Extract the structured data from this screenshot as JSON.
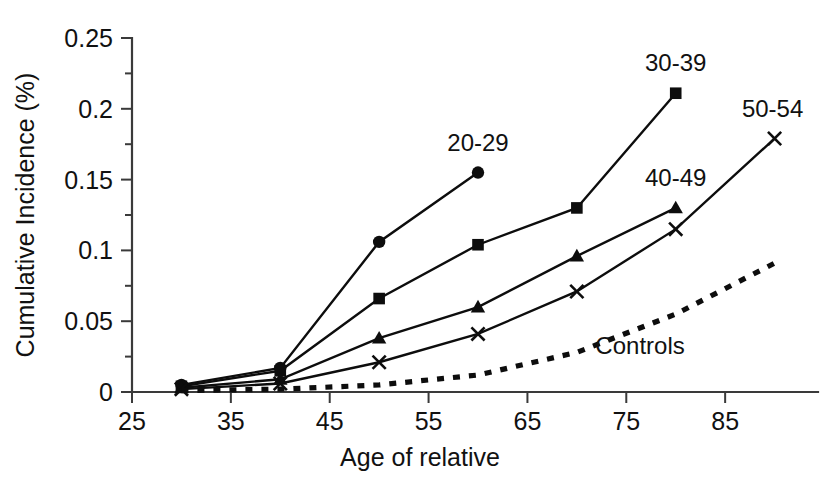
{
  "chart_data": {
    "type": "line",
    "title": "",
    "xlabel": "Age of relative",
    "ylabel": "Cumulative Incidence (%)",
    "xlim": [
      25,
      95
    ],
    "ylim": [
      0,
      0.25
    ],
    "grid": false,
    "legend_position": "inline-endpoint-labels",
    "xticks": [
      "25",
      "35",
      "45",
      "55",
      "65",
      "75",
      "85"
    ],
    "xtick_values": [
      25,
      35,
      45,
      55,
      65,
      75,
      85
    ],
    "yticks": [
      "0",
      "0.05",
      "0.1",
      "0.15",
      "0.2",
      "0.25"
    ],
    "ytick_values": [
      0,
      0.05,
      0.1,
      0.15,
      0.2,
      0.25
    ],
    "series": [
      {
        "name": "20-29",
        "marker": "circle",
        "linestyle": "solid",
        "label_text": "20-29",
        "x": [
          30,
          40,
          50,
          60
        ],
        "values": [
          0.005,
          0.017,
          0.106,
          0.155
        ]
      },
      {
        "name": "30-39",
        "marker": "square",
        "linestyle": "solid",
        "label_text": "30-39",
        "x": [
          30,
          40,
          50,
          60,
          70,
          80
        ],
        "values": [
          0.004,
          0.015,
          0.066,
          0.104,
          0.13,
          0.211
        ]
      },
      {
        "name": "40-49",
        "marker": "triangle",
        "linestyle": "solid",
        "label_text": "40-49",
        "x": [
          30,
          40,
          50,
          60,
          70,
          80
        ],
        "values": [
          0.003,
          0.009,
          0.038,
          0.06,
          0.096,
          0.13
        ]
      },
      {
        "name": "50-54",
        "marker": "x",
        "linestyle": "solid",
        "label_text": "50-54",
        "x": [
          30,
          40,
          50,
          60,
          70,
          80,
          90
        ],
        "values": [
          0.002,
          0.006,
          0.021,
          0.041,
          0.071,
          0.115,
          0.179
        ]
      },
      {
        "name": "Controls",
        "marker": "none",
        "linestyle": "dotted",
        "label_text": "Controls",
        "x": [
          30,
          40,
          50,
          60,
          70,
          80,
          90
        ],
        "values": [
          0.001,
          0.002,
          0.005,
          0.012,
          0.028,
          0.055,
          0.091
        ]
      }
    ],
    "annotations": [
      {
        "text": "20-29",
        "x": 60,
        "y": 0.155,
        "placement": "above"
      },
      {
        "text": "30-39",
        "x": 80,
        "y": 0.211,
        "placement": "above"
      },
      {
        "text": "50-54",
        "x": 90,
        "y": 0.179,
        "placement": "above"
      },
      {
        "text": "40-49",
        "x": 80,
        "y": 0.13,
        "placement": "above"
      },
      {
        "text": "Controls",
        "x": 77,
        "y": 0.048,
        "placement": "below-right"
      }
    ],
    "colors": {
      "line": "#0d0d0d",
      "axis": "#3a3a3a",
      "text": "#111111",
      "background": "#ffffff"
    }
  }
}
